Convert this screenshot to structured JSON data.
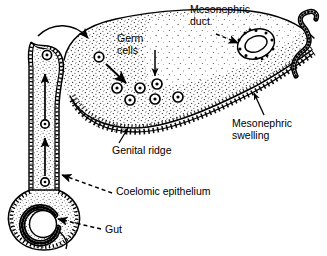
{
  "figure": {
    "background_color": "#ffffff",
    "ink_color": "#000000",
    "width": 327,
    "height": 256
  },
  "labels": {
    "mesonephric_duct": "Mesonephric\nduct",
    "germ_cells": "Germ\ncells",
    "mesonephric_swelling": "Mesonephric\nswelling",
    "genital_ridge": "Genital ridge",
    "coelomic_epithelium": "Coelomic epithelium",
    "gut": "Gut"
  },
  "structures": [
    {
      "name": "gut",
      "shape": "ring",
      "description": "circular gut cross-section at lower left"
    },
    {
      "name": "dorsal-mesentery",
      "shape": "vertical-band",
      "description": "stippled vertical band connecting gut to genital ridge"
    },
    {
      "name": "genital-ridge",
      "shape": "stippled-mass",
      "description": "large stippled swelling with dotted coelomic epithelium border"
    },
    {
      "name": "mesonephric-duct",
      "shape": "oval-ring",
      "description": "oval duct lined with cuboidal cells"
    },
    {
      "name": "mesonephric-tubule",
      "shape": "s-curve-tube",
      "description": "wavy tubule at right edge"
    },
    {
      "name": "coelomic-epithelium",
      "shape": "dotted-border",
      "description": "dotted cell layer lining the surfaces"
    }
  ],
  "germ_cells": {
    "symbol": "circle-with-dot",
    "count": 10,
    "positions": [
      {
        "cx": 45,
        "cy": 182,
        "r": 4.2
      },
      {
        "cx": 45,
        "cy": 124,
        "r": 4.2
      },
      {
        "cx": 47,
        "cy": 55,
        "r": 4.6
      },
      {
        "cx": 99,
        "cy": 57,
        "r": 4.8
      },
      {
        "cx": 117,
        "cy": 88,
        "r": 5.0
      },
      {
        "cx": 140,
        "cy": 88,
        "r": 5.0
      },
      {
        "cx": 157,
        "cy": 84,
        "r": 5.0
      },
      {
        "cx": 130,
        "cy": 100,
        "r": 5.0
      },
      {
        "cx": 155,
        "cy": 99,
        "r": 5.0
      },
      {
        "cx": 178,
        "cy": 97,
        "r": 5.0
      }
    ]
  },
  "migration_arrows": [
    {
      "name": "mesentery-arrow-lower",
      "type": "straight-up",
      "from": [
        45,
        175
      ],
      "to": [
        45,
        140
      ]
    },
    {
      "name": "mesentery-arrow-upper",
      "type": "straight-up",
      "from": [
        45,
        118
      ],
      "to": [
        45,
        73
      ]
    },
    {
      "name": "fold-arrow",
      "type": "curved-arch",
      "description": "arched arrow over the mesentery fold toward the ridge"
    },
    {
      "name": "ridge-entry-arrow",
      "type": "diagonal",
      "from": [
        104,
        63
      ],
      "to": [
        124,
        82
      ]
    }
  ],
  "leader_lines": [
    {
      "name": "mesonephric-duct-leader",
      "style": "dashed-with-arrowhead",
      "target": "mesonephric-duct"
    },
    {
      "name": "germ-cells-leader",
      "style": "solid-thin-arrow",
      "target": "germ-cell"
    },
    {
      "name": "mesonephric-swelling-leader",
      "style": "solid-thin-arrow",
      "target": "mesonephric-swelling"
    },
    {
      "name": "genital-ridge-leader",
      "style": "solid-thin-arrow",
      "target": "genital-ridge"
    },
    {
      "name": "coelomic-epithelium-leader",
      "style": "dashed-with-arrowhead",
      "target": "coelomic-epithelium"
    },
    {
      "name": "gut-leader",
      "style": "dashed-with-arrowhead",
      "target": "gut"
    }
  ]
}
